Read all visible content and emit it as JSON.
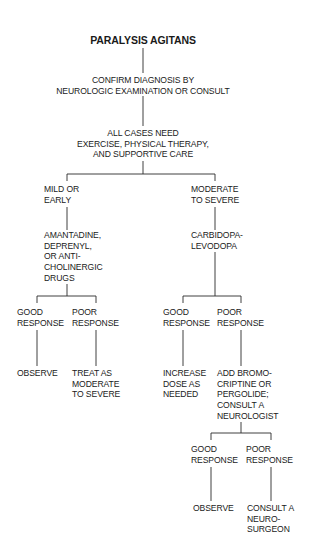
{
  "title": "PARALYSIS AGITANS",
  "nodes": {
    "confirm": [
      "CONFIRM DIAGNOSIS BY",
      "NEUROLOGIC EXAMINATION OR CONSULT"
    ],
    "all_cases": [
      "ALL CASES NEED",
      "EXERCISE, PHYSICAL THERAPY,",
      "AND SUPPORTIVE CARE"
    ],
    "mild": [
      "MILD OR",
      "EARLY"
    ],
    "moderate": [
      "MODERATE",
      "TO SEVERE"
    ],
    "mild_drugs": [
      "AMANTADINE,",
      "DEPRENYL,",
      "OR ANTI-",
      "CHOLINERGIC",
      "DRUGS"
    ],
    "mod_drugs": [
      "CARBIDOPA-",
      "LEVODOPA"
    ],
    "mild_good": [
      "GOOD",
      "RESPONSE"
    ],
    "mild_poor": [
      "POOR",
      "RESPONSE"
    ],
    "mod_good": [
      "GOOD",
      "RESPONSE"
    ],
    "mod_poor": [
      "POOR",
      "RESPONSE"
    ],
    "mild_good_out": [
      "OBSERVE"
    ],
    "mild_poor_out": [
      "TREAT AS",
      "MODERATE",
      "TO SEVERE"
    ],
    "mod_good_out": [
      "INCREASE",
      "DOSE AS",
      "NEEDED"
    ],
    "mod_poor_out": [
      "ADD BROMO-",
      "CRIPTINE OR",
      "PERGOLIDE;",
      "CONSULT A",
      "NEUROLOGIST"
    ],
    "neuro_good": [
      "GOOD",
      "RESPONSE"
    ],
    "neuro_poor": [
      "POOR",
      "RESPONSE"
    ],
    "neuro_good_out": [
      "OBSERVE"
    ],
    "neuro_poor_out": [
      "CONSULT A",
      "NEURO-",
      "SURGEON"
    ]
  },
  "colors": {
    "text": "#1a1a1a",
    "line": "#2a2a2a",
    "background": "#ffffff"
  }
}
